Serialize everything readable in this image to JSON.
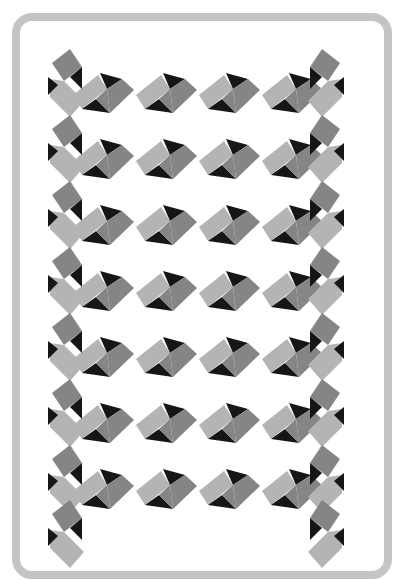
{
  "pattern": {
    "colors": {
      "light": "#b4b4b4",
      "dark": "#858585",
      "black": "#161616",
      "frame": "#c4c4c4"
    },
    "rows_y": [
      93,
      159,
      225,
      291,
      357,
      423,
      489
    ],
    "cols_x": [
      104,
      167,
      230,
      293
    ],
    "chain_left_x": 62,
    "chain_right_x": 330
  }
}
